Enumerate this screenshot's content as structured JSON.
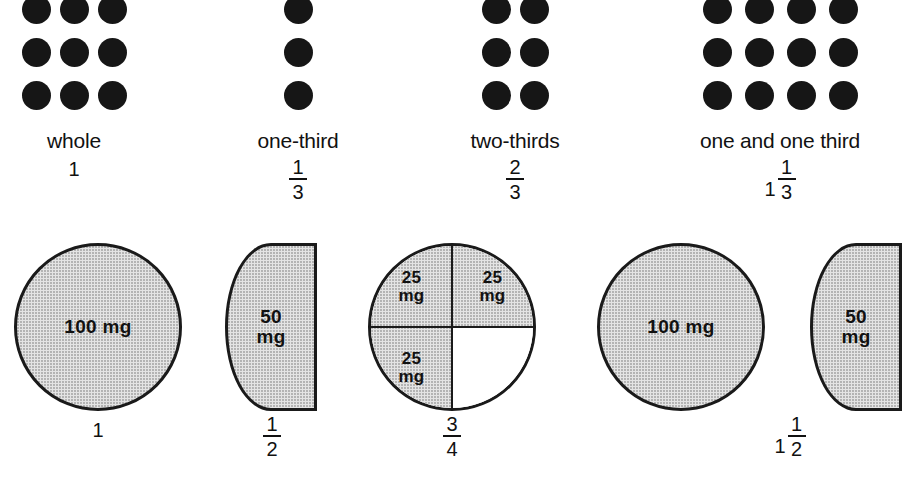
{
  "diagram": {
    "colors": {
      "dot": "#161616",
      "pill_fill": "#e4e4e4",
      "pill_outline": "#1a1a1a",
      "text": "#111111",
      "background": "#ffffff"
    }
  },
  "dot_groups": [
    {
      "name": "whole",
      "caption": "whole",
      "columns": 3,
      "rows": 3,
      "dot_count": 9,
      "value_type": "integer",
      "whole": "1",
      "numerator": "",
      "denominator": ""
    },
    {
      "name": "one-third",
      "caption": "one-third",
      "columns": 1,
      "rows": 3,
      "dot_count": 3,
      "value_type": "fraction",
      "whole": "",
      "numerator": "1",
      "denominator": "3"
    },
    {
      "name": "two-thirds",
      "caption": "two-thirds",
      "columns": 2,
      "rows": 3,
      "dot_count": 6,
      "value_type": "fraction",
      "whole": "",
      "numerator": "2",
      "denominator": "3"
    },
    {
      "name": "one-and-one-third",
      "caption": "one and one third",
      "columns": 4,
      "rows": 3,
      "dot_count": 12,
      "value_type": "mixed",
      "whole": "1",
      "numerator": "1",
      "denominator": "3"
    }
  ],
  "tablets": [
    {
      "name": "whole-tablet-100mg",
      "shape": "full-circle",
      "dose": "100 mg",
      "segments": []
    },
    {
      "name": "half-tablet-50mg",
      "shape": "left-half-circle",
      "dose": "50\nmg",
      "segments": []
    },
    {
      "name": "three-quarter-tablet",
      "shape": "quartered-circle",
      "dose": "",
      "segments": [
        {
          "position": "top-left",
          "filled": true,
          "dose": "25\nmg"
        },
        {
          "position": "top-right",
          "filled": true,
          "dose": "25\nmg"
        },
        {
          "position": "bottom-left",
          "filled": true,
          "dose": "25\nmg"
        },
        {
          "position": "bottom-right",
          "filled": false,
          "dose": ""
        }
      ]
    },
    {
      "name": "whole-tablet-100mg-second",
      "shape": "full-circle",
      "dose": "100 mg",
      "segments": []
    },
    {
      "name": "half-tablet-50mg-second",
      "shape": "left-half-circle",
      "dose": "50\nmg",
      "segments": []
    }
  ],
  "tablet_captions": [
    {
      "name": "caption-one",
      "value_type": "integer",
      "whole": "1",
      "numerator": "",
      "denominator": ""
    },
    {
      "name": "caption-one-half",
      "value_type": "fraction",
      "whole": "",
      "numerator": "1",
      "denominator": "2"
    },
    {
      "name": "caption-three-fourths",
      "value_type": "fraction",
      "whole": "",
      "numerator": "3",
      "denominator": "4"
    },
    {
      "name": "caption-one-and-one-half",
      "value_type": "mixed",
      "whole": "1",
      "numerator": "1",
      "denominator": "2"
    }
  ]
}
